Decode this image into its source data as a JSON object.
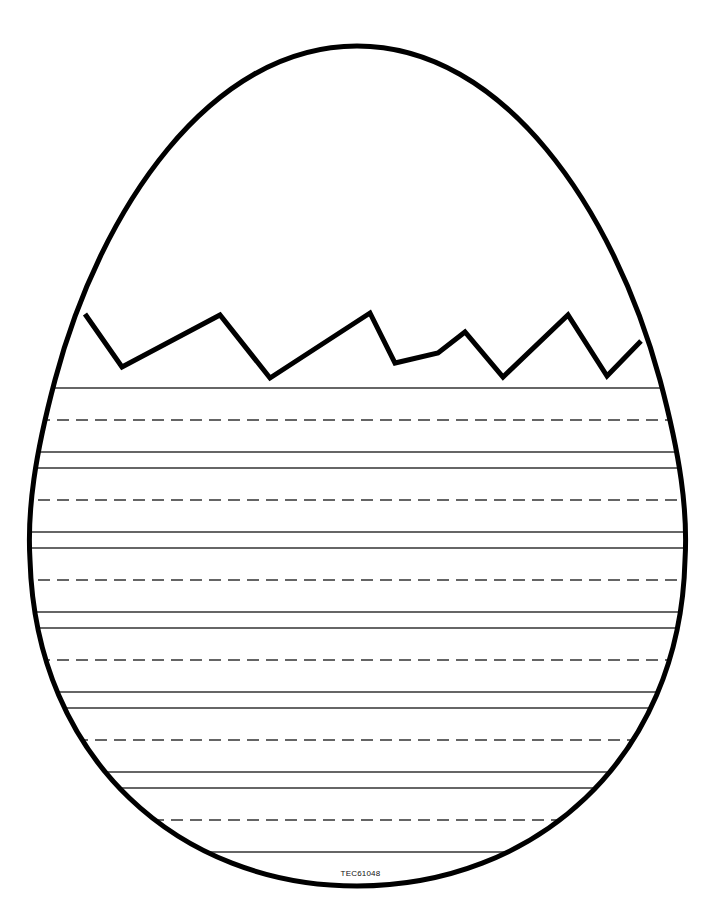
{
  "page": {
    "product_code": "TEC61048"
  },
  "egg": {
    "outline_color": "#000000",
    "outline_width": 5,
    "crack_points": [
      [
        85,
        314
      ],
      [
        122,
        367
      ],
      [
        220,
        315
      ],
      [
        270,
        378
      ],
      [
        370,
        313
      ],
      [
        395,
        363
      ],
      [
        438,
        353
      ],
      [
        465,
        332
      ],
      [
        503,
        377
      ],
      [
        568,
        315
      ],
      [
        607,
        376
      ],
      [
        641,
        341
      ]
    ]
  },
  "writing_lines": {
    "color": "#333333",
    "rows": [
      {
        "y": 388,
        "style": "solid"
      },
      {
        "y": 420,
        "style": "dashed"
      },
      {
        "y": 452,
        "style": "solid"
      },
      {
        "y": 468,
        "style": "solid"
      },
      {
        "y": 500,
        "style": "dashed"
      },
      {
        "y": 532,
        "style": "solid"
      },
      {
        "y": 548,
        "style": "solid"
      },
      {
        "y": 580,
        "style": "dashed"
      },
      {
        "y": 612,
        "style": "solid"
      },
      {
        "y": 628,
        "style": "solid"
      },
      {
        "y": 660,
        "style": "dashed"
      },
      {
        "y": 692,
        "style": "solid"
      },
      {
        "y": 708,
        "style": "solid"
      },
      {
        "y": 740,
        "style": "dashed"
      },
      {
        "y": 772,
        "style": "solid"
      },
      {
        "y": 788,
        "style": "solid"
      },
      {
        "y": 820,
        "style": "dashed"
      },
      {
        "y": 852,
        "style": "solid"
      }
    ]
  }
}
